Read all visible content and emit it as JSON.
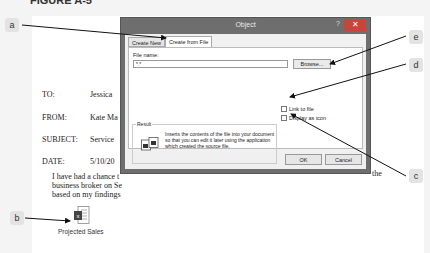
{
  "figure": {
    "caption": "FIGURE A-5"
  },
  "document": {
    "rows": [
      {
        "label": "TO:",
        "value": "Jessica"
      },
      {
        "label": "FROM:",
        "value": "Kate Ma"
      },
      {
        "label": "SUBJECT:",
        "value": "Service"
      },
      {
        "label": "DATE:",
        "value": "5/10/20"
      }
    ],
    "body_lines": [
      "I have had a chance t",
      "business broker on Se",
      "based on my findings"
    ],
    "body_tail": "the",
    "embedded_object": {
      "icon": "excel-file-icon",
      "label": "Projected Sales"
    }
  },
  "dialog": {
    "title": "Object",
    "help": "?",
    "close": "✕",
    "tabs": [
      {
        "label": "Create New",
        "active": false
      },
      {
        "label": "Create from File",
        "active": true
      }
    ],
    "file_name_label": "File name:",
    "file_name_value": "*.*",
    "browse_label": "Browse...",
    "link_to_file_label": "Link to file",
    "display_as_icon_label": "Display as icon",
    "result_label": "Result",
    "result_text": "Inserts the contents of the file into your document so that you can edit it later using the application which created the source file.",
    "ok_label": "OK",
    "cancel_label": "Cancel"
  },
  "callouts": [
    {
      "id": "a",
      "label": "a"
    },
    {
      "id": "b",
      "label": "b"
    },
    {
      "id": "c",
      "label": "c"
    },
    {
      "id": "d",
      "label": "d"
    },
    {
      "id": "e",
      "label": "e"
    }
  ]
}
